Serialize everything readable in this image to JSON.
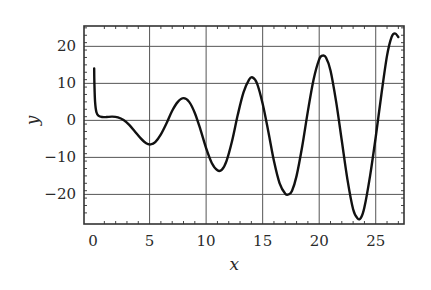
{
  "chart_data": {
    "type": "line",
    "title": "",
    "xlabel": "x",
    "ylabel": "y",
    "xlim": [
      -0.8,
      27.5
    ],
    "ylim": [
      -28,
      25.5
    ],
    "grid": true,
    "legend": "none",
    "xticks": [
      0,
      5,
      10,
      15,
      20,
      25
    ],
    "xtick_labels": [
      "0",
      "5",
      "10",
      "15",
      "20",
      "25"
    ],
    "yticks": [
      20,
      10,
      0,
      -10,
      -20
    ],
    "ytick_labels": [
      "20",
      "10",
      "0",
      "−10",
      "−20"
    ],
    "series": [
      {
        "name": "y(x)",
        "x": [
          0.1,
          0.12,
          0.18,
          0.3,
          0.5,
          0.8,
          1.2,
          1.7,
          2.2,
          2.7,
          3.2,
          3.7,
          4.2,
          4.7,
          5.1,
          5.5,
          6.0,
          6.5,
          7.0,
          7.5,
          8.0,
          8.5,
          9.0,
          9.5,
          10.0,
          10.5,
          11.0,
          11.4,
          11.8,
          12.3,
          12.8,
          13.3,
          13.8,
          14.1,
          14.5,
          15.0,
          15.5,
          16.0,
          16.5,
          17.0,
          17.3,
          17.6,
          18.0,
          18.5,
          19.0,
          19.5,
          20.0,
          20.3,
          20.6,
          21.0,
          21.5,
          22.0,
          22.5,
          23.0,
          23.4,
          23.7,
          24.0,
          24.5,
          25.0,
          25.5,
          26.0,
          26.4,
          26.7,
          27.0
        ],
        "y": [
          14,
          10,
          5,
          2.2,
          1.2,
          0.9,
          0.9,
          1.0,
          0.8,
          0.1,
          -1.2,
          -3.0,
          -4.8,
          -6.2,
          -6.5,
          -5.9,
          -3.8,
          -0.8,
          2.6,
          5.0,
          6.0,
          5.0,
          2.0,
          -2.5,
          -7.5,
          -11.5,
          -13.5,
          -13.3,
          -11.0,
          -5.5,
          1.5,
          7.5,
          11.0,
          11.6,
          10.0,
          4.5,
          -3.0,
          -11.0,
          -17.0,
          -19.8,
          -20.0,
          -19.0,
          -15.0,
          -7.0,
          2.5,
          11.0,
          16.5,
          17.5,
          17.0,
          13.5,
          5.0,
          -5.5,
          -16.0,
          -24.0,
          -26.5,
          -26.3,
          -23.5,
          -15.0,
          -4.5,
          7.0,
          17.5,
          22.5,
          23.5,
          22.5
        ]
      }
    ]
  }
}
